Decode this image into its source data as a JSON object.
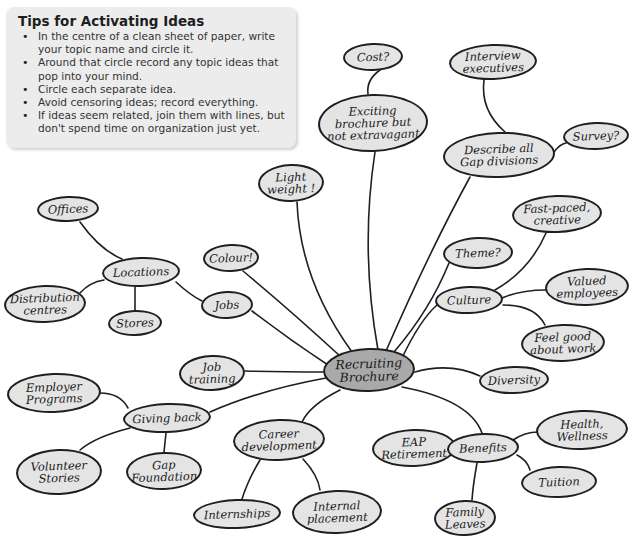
{
  "tips": {
    "title": "Tips for Activating Ideas",
    "items": [
      "In the centre of a clean sheet of paper, write your topic name and circle it.",
      "Around that circle record any topic ideas that pop into your mind.",
      "Circle each separate idea.",
      "Avoid censoring ideas; record everything.",
      "If ideas seem related, join them with lines, but don't spend time on organization just yet."
    ]
  },
  "colors": {
    "node_fill": "#e4e4e4",
    "center_fill": "#a9a9a9",
    "outline": "#1f1f1f",
    "tips_bg": "#ececec"
  },
  "mindmap": {
    "center": "Recruiting\nBrochure",
    "nodes": {
      "cost": "Cost?",
      "exciting": "Exciting\nbrochure but\nnot extravagant",
      "interview": "Interview\nexecutives",
      "describe": "Describe all\nGap divisions",
      "survey": "Survey?",
      "offices": "Offices",
      "light": "Light\nweight !",
      "colour": "Colour!",
      "fastpaced": "Fast-paced,\ncreative",
      "theme": "Theme?",
      "locations": "Locations",
      "distribution": "Distribution\ncentres",
      "stores": "Stores",
      "jobs": "Jobs",
      "culture": "Culture",
      "valued": "Valued\nemployees",
      "feelgood": "Feel good\nabout work",
      "jobtraining": "Job\ntraining",
      "diversity": "Diversity",
      "employer": "Employer\nPrograms",
      "giving": "Giving back",
      "volunteer": "Volunteer\nStories",
      "gapfoundation": "Gap\nFoundation",
      "career": "Career\ndevelopment",
      "eap": "EAP\nRetirement",
      "benefits": "Benefits",
      "health": "Health,\nWellness",
      "tuition": "Tuition",
      "internships": "Internships",
      "internal": "Internal\nplacement",
      "family": "Family\nLeaves"
    }
  }
}
